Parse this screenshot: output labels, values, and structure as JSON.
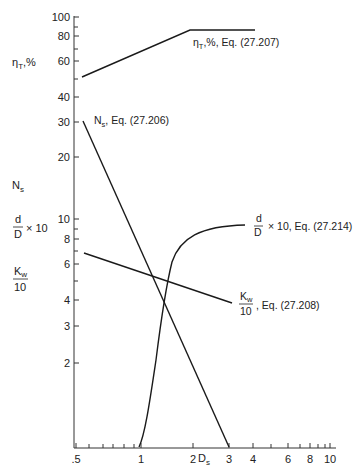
{
  "chart_data": {
    "type": "line",
    "title": "",
    "xlabel": "D_s",
    "x_scale": "log",
    "xlim": [
      0.5,
      10
    ],
    "x_ticks": [
      ".5",
      "1",
      "2",
      "3",
      "4",
      "6",
      "8",
      "10"
    ],
    "y_axes": [
      {
        "name": "upper",
        "label": "η_T,%",
        "scale": "log",
        "ticks": [
          "100",
          "80",
          "60",
          "40"
        ]
      },
      {
        "name": "lower",
        "labels": [
          "N_s",
          "d/D × 10",
          "K_w/10"
        ],
        "scale": "log",
        "ticks": [
          "30",
          "20",
          "10",
          "8",
          "6",
          "4",
          "3",
          "2"
        ]
      }
    ],
    "series": [
      {
        "name": "η_T,%, Eq. (27.207)",
        "axis": "upper",
        "x": [
          0.55,
          1.9,
          4.0
        ],
        "y": [
          50,
          86,
          86
        ]
      },
      {
        "name": "N_s, Eq. (27.206)",
        "axis": "lower",
        "x": [
          0.55,
          3.0
        ],
        "y": [
          30,
          0.77
        ]
      },
      {
        "name": "K_w/10, Eq. (27.208)",
        "axis": "lower",
        "x": [
          0.55,
          3.0
        ],
        "y": [
          6.8,
          4.0
        ]
      },
      {
        "name": "d/D × 10, Eq. (27.214)",
        "axis": "lower",
        "x": [
          1.0,
          1.2,
          1.4,
          1.6,
          2.0,
          2.5,
          3.6
        ],
        "y": [
          0.77,
          2.0,
          4.0,
          5.5,
          7.5,
          8.8,
          9.4
        ]
      }
    ],
    "grid": false,
    "legend": "inline annotations"
  },
  "labels": {
    "eta_axis": "η",
    "eta_sub": "T",
    "eta_suffix": ",%",
    "ns_axis": "N",
    "ns_sub": "s",
    "dD_num": "d",
    "dD_den": "D",
    "dD_mult": "× 10",
    "kw_num": "K",
    "kw_sub": "w",
    "kw_den": "10",
    "xlabel_main": "D",
    "xlabel_sub": "s"
  },
  "annotations": {
    "eta": {
      "sym": "η",
      "sub": "T",
      "text": ",%, Eq. (27.207)"
    },
    "ns": {
      "sym": "N",
      "sub": "s",
      "text": ", Eq. (27.206)"
    },
    "dD": {
      "num": "d",
      "den": "D",
      "text": "× 10, Eq. (27.214)"
    },
    "kw": {
      "num": "K",
      "sub": "w",
      "den": "10",
      "text": ", Eq. (27.208)"
    }
  },
  "upper_ticks": [
    {
      "label": "100",
      "y": 17
    },
    {
      "label": "80",
      "y": 36
    },
    {
      "label": "60",
      "y": 61
    },
    {
      "label": "40",
      "y": 97
    }
  ],
  "upper_minor": [
    27,
    49,
    79
  ],
  "lower_ticks": [
    {
      "label": "30",
      "y": 122
    },
    {
      "label": "20",
      "y": 157
    },
    {
      "label": "10",
      "y": 219
    },
    {
      "label": "8",
      "y": 239
    },
    {
      "label": "6",
      "y": 264
    },
    {
      "label": "4",
      "y": 300
    },
    {
      "label": "3",
      "y": 326
    },
    {
      "label": "2",
      "y": 363
    }
  ],
  "lower_minor": [
    229,
    251,
    281
  ],
  "x_ticks": [
    {
      "label": ".5",
      "x": 76
    },
    {
      "label": "1",
      "x": 141
    },
    {
      "label": "2",
      "x": 193
    },
    {
      "label": "3",
      "x": 229
    },
    {
      "label": "4",
      "x": 253
    },
    {
      "label": "6",
      "x": 288
    },
    {
      "label": "8",
      "x": 310
    },
    {
      "label": "10",
      "x": 330
    }
  ],
  "x_minor": [
    89,
    103,
    113,
    124,
    134,
    271,
    300,
    318,
    325
  ]
}
